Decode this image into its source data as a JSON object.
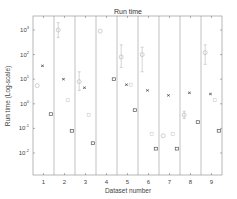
{
  "chart_data": {
    "type": "scatter",
    "title": "Run time",
    "xlabel": "Dataset number",
    "ylabel": "Run time (Log-scale)",
    "yscale": "log",
    "ylim": [
      0.001,
      2000
    ],
    "yticks": [
      "10^-2",
      "10^-1",
      "10^0",
      "10^1",
      "10^2",
      "10^3"
    ],
    "ytick_values": [
      0.01,
      0.1,
      1,
      10,
      100,
      1000
    ],
    "categories": [
      "1",
      "2",
      "3",
      "4",
      "5",
      "6",
      "7",
      "8",
      "9"
    ],
    "grid": false,
    "separators": true,
    "series": [
      {
        "name": "method-A (light circle, error bar)",
        "marker": "circle",
        "color": "#bbbbbb",
        "values": [
          5.5,
          1000,
          8,
          900,
          80,
          100,
          0.05,
          0.35,
          120
        ],
        "err_low": [
          null,
          500,
          3.5,
          null,
          30,
          20,
          null,
          0.25,
          40
        ],
        "err_high": [
          null,
          2000,
          20,
          null,
          250,
          200,
          null,
          0.5,
          250
        ]
      },
      {
        "name": "method-B (dark x)",
        "marker": "x",
        "color": "#444444",
        "values": [
          35,
          10,
          4.5,
          null,
          6,
          3.5,
          2.2,
          2.8,
          2.5
        ]
      },
      {
        "name": "method-C (light marker)",
        "marker": "diamond",
        "color": "#cccccc",
        "values": [
          null,
          1.4,
          0.35,
          null,
          6,
          0.06,
          0.06,
          null,
          1.4
        ]
      },
      {
        "name": "method-D (dark square)",
        "marker": "square",
        "color": "#555555",
        "values": [
          0.38,
          0.08,
          0.025,
          10,
          0.55,
          0.015,
          0.015,
          0.18,
          0.08
        ]
      }
    ]
  }
}
